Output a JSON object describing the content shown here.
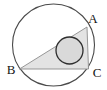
{
  "figure": {
    "canvas": {
      "width": 107,
      "height": 90,
      "background": "#ffffff"
    },
    "colors": {
      "outer_circle_stroke": "#4a4a4a",
      "outer_circle_fill": "#ffffff",
      "triangle_fill": "#e3e3e3",
      "triangle_stroke": "#8c8c8c",
      "inner_circle_fill": "#d9d9d9",
      "inner_circle_stroke": "#2e2e2e",
      "label_color": "#141414"
    },
    "outer_circle": {
      "cx": 53.5,
      "cy": 45,
      "r": 41,
      "stroke_width": 1.1
    },
    "inner_circle": {
      "cx": 69.5,
      "cy": 50.5,
      "r": 13.5,
      "stroke_width": 1.3
    },
    "triangle": {
      "points": "87,27 19.5,69 88.5,69",
      "stroke_width": 0.9,
      "vertices": [
        {
          "name": "A",
          "x": 87,
          "y": 27
        },
        {
          "name": "B",
          "x": 19.5,
          "y": 69
        },
        {
          "name": "C",
          "x": 88.5,
          "y": 69
        }
      ]
    },
    "labels": {
      "a": {
        "text": "A",
        "x": 93,
        "y": 23
      },
      "b": {
        "text": "B",
        "x": 11,
        "y": 74
      },
      "c": {
        "text": "C",
        "x": 97,
        "y": 77
      }
    }
  }
}
